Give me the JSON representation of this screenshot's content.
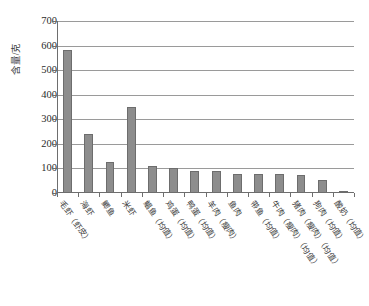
{
  "chart_data": {
    "type": "bar",
    "title": "",
    "xlabel": "",
    "ylabel": "含量/克",
    "ylim": [
      0,
      700
    ],
    "ytick_values": [
      700,
      600,
      500,
      400,
      300,
      200,
      100,
      0
    ],
    "ytick_labels": [
      "700",
      "600",
      "500",
      "400",
      "300",
      "200",
      "100",
      "0"
    ],
    "grid": true,
    "legend": "none",
    "bar_color": "#8d8d8d",
    "categories": [
      "毛虾（虾皮）",
      "海虾",
      "鲫鱼",
      "米虾",
      "鲳鱼（均值）",
      "鸡蛋（均值）",
      "鸭蛋（均值）",
      "羊肉（瘦肉）",
      "鱼肉",
      "带鱼（均值）",
      "牛肉（瘦肉）（均值）",
      "猪肉（瘦肉）（均值）",
      "狗肉（均值）",
      "酸奶（均值）"
    ],
    "values": [
      582,
      240,
      128,
      350,
      110,
      100,
      90,
      88,
      79,
      78,
      77,
      72,
      53,
      9
    ]
  }
}
